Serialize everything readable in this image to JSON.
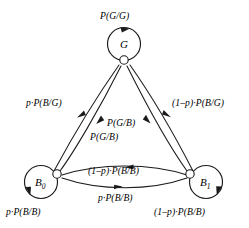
{
  "diagram": {
    "type": "state-transition-graph",
    "background_color": "#ffffff",
    "stroke_color": "#1a1a1a",
    "nodes": [
      {
        "id": "G",
        "label": "G",
        "sub": "",
        "x": 124,
        "y": 60,
        "loop": "top"
      },
      {
        "id": "B0",
        "label": "B",
        "sub": "0",
        "x": 57,
        "y": 174,
        "loop": "left"
      },
      {
        "id": "B1",
        "label": "B",
        "sub": "1",
        "x": 190,
        "y": 174,
        "loop": "right"
      }
    ],
    "labels": {
      "loop_g": "P(G/G)",
      "loop_b0": "p·P(B/B)",
      "loop_b1": "(1–p)·P(B/B)",
      "g_to_b0": "p·P(B/G)",
      "g_to_b1": "(1–p)·P(B/G)",
      "b1_to_g": "P(G/B)",
      "b0_to_g": "P(G/B)",
      "b0_to_b1": "(1–p)·P(B/B)",
      "b1_to_b0": "p·P(B/B)"
    },
    "edges": [
      {
        "name": "self-loop-g",
        "from": "G",
        "to": "G",
        "label_key": "loop_g"
      },
      {
        "name": "self-loop-b0",
        "from": "B0",
        "to": "B0",
        "label_key": "loop_b0"
      },
      {
        "name": "self-loop-b1",
        "from": "B1",
        "to": "B1",
        "label_key": "loop_b1"
      },
      {
        "name": "edge-g-to-b0",
        "from": "G",
        "to": "B0",
        "label_key": "g_to_b0"
      },
      {
        "name": "edge-g-to-b1",
        "from": "G",
        "to": "B1",
        "label_key": "g_to_b1"
      },
      {
        "name": "edge-b0-to-g",
        "from": "B0",
        "to": "G",
        "label_key": "b0_to_g"
      },
      {
        "name": "edge-b1-to-g",
        "from": "B1",
        "to": "G",
        "label_key": "b1_to_g"
      },
      {
        "name": "edge-b0-to-b1",
        "from": "B0",
        "to": "B1",
        "label_key": "b0_to_b1"
      },
      {
        "name": "edge-b1-to-b0",
        "from": "B1",
        "to": "B0",
        "label_key": "b1_to_b0"
      }
    ]
  }
}
